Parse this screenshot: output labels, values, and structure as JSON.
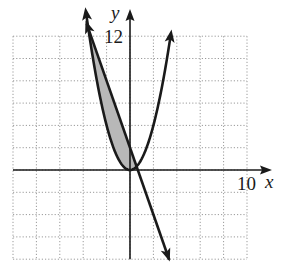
{
  "chart_data": {
    "type": "line",
    "title": "",
    "xlabel": "x",
    "ylabel": "y",
    "xlim": [
      -10,
      10
    ],
    "ylim": [
      -8,
      12
    ],
    "grid": true,
    "grid_step": 2,
    "tick_labels": {
      "x": [
        "10"
      ],
      "y": [
        "12"
      ]
    },
    "series": [
      {
        "name": "parabola",
        "equation": "y = x^2",
        "x": [
          -3.56,
          -3,
          -2,
          -1,
          0,
          1,
          2,
          3,
          3.46
        ],
        "values": [
          12.7,
          9,
          4,
          1,
          0,
          1,
          4,
          9,
          12
        ],
        "arrows": "both ends"
      },
      {
        "name": "line",
        "equation": "y = -3x + 2",
        "x": [
          -3.56,
          0,
          0.667,
          3.33
        ],
        "values": [
          12.7,
          2,
          0,
          -8
        ],
        "arrows": "both ends"
      }
    ],
    "shaded_region": {
      "description": "region between y = -3x + 2 (above) and y = x^2 (below)",
      "x_range": [
        -3.56,
        0.56
      ],
      "fill": "#b8b8b8"
    },
    "intersections": [
      [
        -3.56,
        12.68
      ],
      [
        0.56,
        0.32
      ]
    ]
  },
  "labels": {
    "x_axis": "x",
    "y_axis": "y",
    "x_tick": "10",
    "y_tick": "12"
  },
  "colors": {
    "curve": "#1a1a1a",
    "grid": "#9a9a9a",
    "shade": "#b8b8b8"
  }
}
